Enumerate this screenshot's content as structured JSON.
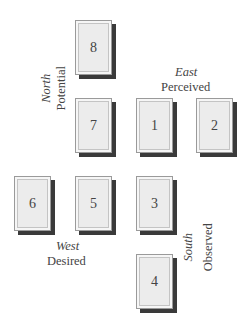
{
  "cards": [
    {
      "id": "8",
      "label": "8"
    },
    {
      "id": "7",
      "label": "7"
    },
    {
      "id": "1",
      "label": "1"
    },
    {
      "id": "2",
      "label": "2"
    },
    {
      "id": "6",
      "label": "6"
    },
    {
      "id": "5",
      "label": "5"
    },
    {
      "id": "3",
      "label": "3"
    },
    {
      "id": "4",
      "label": "4"
    }
  ],
  "directions": {
    "north": {
      "direction": "North",
      "label": "Potential"
    },
    "east": {
      "direction": "East",
      "label": "Perceived"
    },
    "west": {
      "direction": "West",
      "label": "Desired"
    },
    "south": {
      "direction": "South",
      "label": "Observed"
    }
  }
}
